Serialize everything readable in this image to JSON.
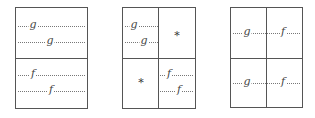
{
  "panels": [
    {
      "id": "panel-1",
      "layout": "two rows",
      "cells": [
        {
          "region": "top",
          "lines": [
            {
              "label": "g"
            },
            {
              "label": "g"
            }
          ]
        },
        {
          "region": "bottom",
          "lines": [
            {
              "label": "f"
            },
            {
              "label": "f"
            }
          ]
        }
      ]
    },
    {
      "id": "panel-2",
      "layout": "2x2 grid",
      "cells": [
        {
          "region": "top-left",
          "lines": [
            {
              "label": "g"
            },
            {
              "label": "g"
            }
          ]
        },
        {
          "region": "top-right",
          "marker": "*"
        },
        {
          "region": "bottom-left",
          "marker": "*"
        },
        {
          "region": "bottom-right",
          "lines": [
            {
              "label": "f"
            },
            {
              "label": "f"
            }
          ]
        }
      ]
    },
    {
      "id": "panel-3",
      "layout": "2x2 grid",
      "cells": [
        {
          "region": "top-row",
          "lines": [
            {
              "label": "g"
            },
            {
              "label": "f"
            }
          ]
        },
        {
          "region": "bottom-row",
          "lines": [
            {
              "label": "g"
            },
            {
              "label": "f"
            }
          ]
        }
      ]
    }
  ],
  "colors": {
    "border": "#555555",
    "dotted": "#777777",
    "text": "#444444"
  }
}
